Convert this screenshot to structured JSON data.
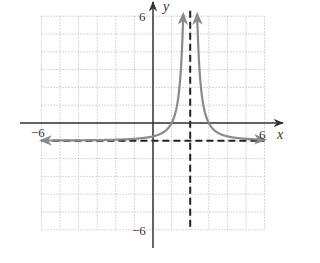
{
  "chart_data": {
    "type": "line",
    "title": "",
    "xlabel": "x",
    "ylabel": "y",
    "xlim": [
      -6,
      6
    ],
    "ylim": [
      -6,
      6
    ],
    "grid": true,
    "grid_style": "dotted",
    "tick_labels": {
      "x_min": "−6",
      "x_max": "6",
      "y_min": "−6",
      "y_max": "6"
    },
    "function": "y = 1/(x − 2)² − 1",
    "asymptotes": {
      "vertical": {
        "x": 2,
        "style": "dashed"
      },
      "horizontal": {
        "y": -1,
        "style": "dashed"
      }
    },
    "series": [
      {
        "name": "left branch",
        "x": [
          -6,
          -4,
          -2,
          -1,
          0,
          1,
          1.5,
          1.6
        ],
        "y": [
          -0.984,
          -0.972,
          -0.9375,
          -0.889,
          -0.75,
          0,
          3,
          5.25
        ],
        "arrows": "both"
      },
      {
        "name": "right branch",
        "x": [
          2.4,
          2.5,
          3,
          4,
          5,
          6
        ],
        "y": [
          5.25,
          3,
          0,
          -0.75,
          -0.889,
          -0.9375
        ],
        "arrows": "both"
      }
    ],
    "colors": {
      "curve": "#8a8a8a",
      "axes": "#333333",
      "asymptote": "#222222",
      "grid": "#bbbbbb"
    }
  }
}
